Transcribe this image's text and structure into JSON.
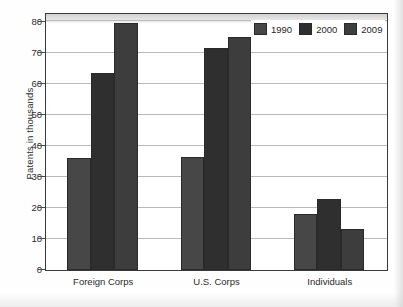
{
  "chart_data": {
    "type": "bar",
    "title": "",
    "xlabel": "",
    "ylabel": "Patents in thousands",
    "categories": [
      "Foreign Corps",
      "U.S. Corps",
      "Individuals"
    ],
    "series": [
      {
        "name": "1990",
        "color": "#474747",
        "values": [
          36,
          36.5,
          18
        ]
      },
      {
        "name": "2000",
        "color": "#2f2f2f",
        "values": [
          63.5,
          71.5,
          23
        ]
      },
      {
        "name": "2009",
        "color": "#3d3d3d",
        "values": [
          79.5,
          75,
          13.2
        ]
      }
    ],
    "ylim": [
      0,
      82
    ],
    "yticks": [
      0,
      10,
      20,
      30,
      40,
      50,
      60,
      70,
      80
    ],
    "ytick_labels": [
      "0",
      "10",
      "20",
      "30",
      "40",
      "50",
      "60",
      "70",
      "80"
    ],
    "grid": true,
    "legend_position": "top-right",
    "legend_entries": [
      "1990",
      "2000",
      "2009"
    ]
  },
  "axes": {
    "y_title": "Patents in thousands"
  }
}
